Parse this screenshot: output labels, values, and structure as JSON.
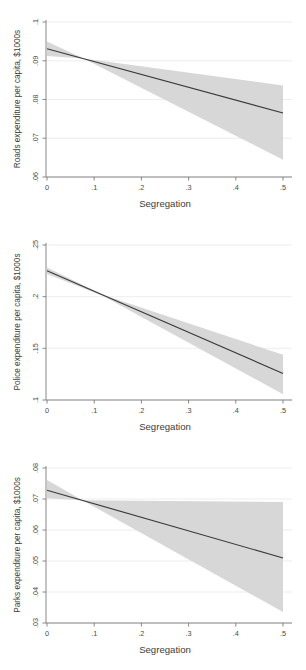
{
  "figure": {
    "background": "#ffffff",
    "line_color": "#3a3a3a",
    "band_color": "#d4d4d4",
    "axis_color": "#7a7a7a",
    "grid_color": "#e9e9e9"
  },
  "chart_data": [
    {
      "type": "line",
      "title": "",
      "xlabel": "Segregation",
      "ylabel": "Roads expenditure per capita, $1000s",
      "xlim": [
        0,
        0.5
      ],
      "ylim": [
        0.06,
        0.1
      ],
      "xticks": [
        0,
        0.1,
        0.2,
        0.3,
        0.4,
        0.5
      ],
      "xticklabels": [
        "0",
        ".1",
        ".2",
        ".3",
        ".4",
        ".5"
      ],
      "yticks": [
        0.06,
        0.07,
        0.08,
        0.09,
        0.1
      ],
      "yticklabels": [
        ".06",
        ".07",
        ".08",
        ".09",
        ".1"
      ],
      "grid": "horizontal",
      "legend": "none",
      "series": [
        {
          "name": "fitted",
          "x": [
            0,
            0.5
          ],
          "values": [
            0.0927,
            0.0763
          ]
        },
        {
          "name": "ci_upper",
          "x": [
            0,
            0.0775,
            0.5
          ],
          "values": [
            0.0945,
            0.0902,
            0.0833
          ]
        },
        {
          "name": "ci_lower",
          "x": [
            0,
            0.0775,
            0.5
          ],
          "values": [
            0.0908,
            0.0902,
            0.0644
          ]
        }
      ]
    },
    {
      "type": "line",
      "title": "",
      "xlabel": "Segregation",
      "ylabel": "Police expenditure per capita, $1000s",
      "xlim": [
        0,
        0.5
      ],
      "ylim": [
        0.1,
        0.25
      ],
      "xticks": [
        0,
        0.1,
        0.2,
        0.3,
        0.4,
        0.5
      ],
      "xticklabels": [
        "0",
        ".1",
        ".2",
        ".3",
        ".4",
        ".5"
      ],
      "yticks": [
        0.1,
        0.15,
        0.2,
        0.25
      ],
      "yticklabels": [
        ".1",
        ".15",
        ".2",
        ".25"
      ],
      "grid": "horizontal",
      "legend": "none",
      "series": [
        {
          "name": "fitted",
          "x": [
            0,
            0.5
          ],
          "values": [
            0.2235,
            0.1253
          ]
        },
        {
          "name": "ci_upper",
          "x": [
            0,
            0.12,
            0.5
          ],
          "values": [
            0.2265,
            0.2002,
            0.1432
          ]
        },
        {
          "name": "ci_lower",
          "x": [
            0,
            0.12,
            0.5
          ],
          "values": [
            0.2205,
            0.1991,
            0.1055
          ]
        }
      ]
    },
    {
      "type": "line",
      "title": "",
      "xlabel": "Segregation",
      "ylabel": "Parks expenditure per capita, $1000s",
      "xlim": [
        0,
        0.5
      ],
      "ylim": [
        0.03,
        0.08
      ],
      "xticks": [
        0,
        0.1,
        0.2,
        0.3,
        0.4,
        0.5
      ],
      "xticklabels": [
        "0",
        ".1",
        ".2",
        ".3",
        ".4",
        ".5"
      ],
      "yticks": [
        0.03,
        0.04,
        0.05,
        0.06,
        0.07,
        0.08
      ],
      "yticklabels": [
        ".03",
        ".04",
        ".05",
        ".06",
        ".07",
        ".08"
      ],
      "grid": "horizontal",
      "legend": "none",
      "series": [
        {
          "name": "fitted",
          "x": [
            0,
            0.5
          ],
          "values": [
            0.0723,
            0.0507
          ]
        },
        {
          "name": "ci_upper",
          "x": [
            0,
            0.075,
            0.5
          ],
          "values": [
            0.0755,
            0.0691,
            0.0685
          ]
        },
        {
          "name": "ci_lower",
          "x": [
            0,
            0.075,
            0.5
          ],
          "values": [
            0.0697,
            0.0691,
            0.0335
          ]
        }
      ]
    }
  ]
}
